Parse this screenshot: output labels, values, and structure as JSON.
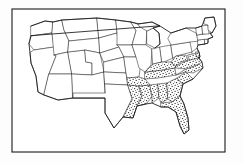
{
  "figure": {
    "kind": "map",
    "frame": {
      "present": true,
      "stroke_color": "#1a1a1a",
      "x": 12,
      "y": 9,
      "width": 213,
      "height": 143
    },
    "colors": {
      "background": "#ffffff",
      "page": "#fdfdfd",
      "outline": "#161616",
      "state_border": "#2b2b2b",
      "stipple_dot": "#151515",
      "unshaded_fill": "#ffffff"
    },
    "legend": {
      "present": false,
      "entries": []
    },
    "labels": {
      "present": false,
      "items": []
    },
    "caption": ""
  },
  "map_data": {
    "region": "Contiguous United States",
    "projection_note": "simplified hand-drawn outline",
    "shaded_pattern": "stipple-dots",
    "shaded_meaning": "highlighted southeastern region",
    "shaded_states": [
      "Texas (eastern)",
      "Louisiana",
      "Arkansas",
      "Mississippi",
      "Alabama",
      "Tennessee",
      "Kentucky",
      "Georgia",
      "Florida",
      "South Carolina",
      "North Carolina",
      "Virginia",
      "West Virginia",
      "Maryland",
      "Delaware"
    ],
    "unshaded_states": [
      "Washington",
      "Oregon",
      "California",
      "Idaho",
      "Nevada",
      "Utah",
      "Arizona",
      "Montana",
      "Wyoming",
      "Colorado",
      "New Mexico",
      "North Dakota",
      "South Dakota",
      "Nebraska",
      "Kansas",
      "Oklahoma",
      "Texas (western)",
      "Minnesota",
      "Iowa",
      "Missouri",
      "Wisconsin",
      "Illinois",
      "Michigan",
      "Indiana",
      "Ohio",
      "Pennsylvania",
      "New York",
      "New Jersey",
      "Connecticut",
      "Rhode Island",
      "Massachusetts",
      "Vermont",
      "New Hampshire",
      "Maine"
    ],
    "counts": {
      "shaded": 15,
      "unshaded": 34
    }
  }
}
